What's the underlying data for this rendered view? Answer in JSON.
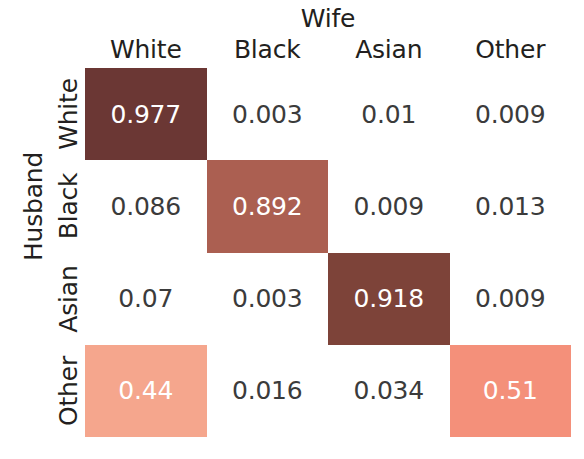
{
  "chart_data": {
    "type": "heatmap",
    "title": "",
    "xlabel": "Wife",
    "ylabel": "Husband",
    "categories_x": [
      "White",
      "Black",
      "Asian",
      "Other"
    ],
    "categories_y": [
      "White",
      "Black",
      "Asian",
      "Other"
    ],
    "grid": false,
    "legend": "none",
    "value_range": [
      0,
      1
    ],
    "rows": [
      {
        "label": "White",
        "cells": [
          {
            "value": "0.977",
            "filled": true,
            "color": "#6b3734"
          },
          {
            "value": "0.003",
            "filled": false,
            "color": "#ffffff"
          },
          {
            "value": "0.01",
            "filled": false,
            "color": "#ffffff"
          },
          {
            "value": "0.009",
            "filled": false,
            "color": "#ffffff"
          }
        ]
      },
      {
        "label": "Black",
        "cells": [
          {
            "value": "0.086",
            "filled": false,
            "color": "#ffffff"
          },
          {
            "value": "0.892",
            "filled": true,
            "color": "#ab5f51"
          },
          {
            "value": "0.009",
            "filled": false,
            "color": "#ffffff"
          },
          {
            "value": "0.013",
            "filled": false,
            "color": "#ffffff"
          }
        ]
      },
      {
        "label": "Asian",
        "cells": [
          {
            "value": "0.07",
            "filled": false,
            "color": "#ffffff"
          },
          {
            "value": "0.003",
            "filled": false,
            "color": "#ffffff"
          },
          {
            "value": "0.918",
            "filled": true,
            "color": "#7d4339"
          },
          {
            "value": "0.009",
            "filled": false,
            "color": "#ffffff"
          }
        ]
      },
      {
        "label": "Other",
        "cells": [
          {
            "value": "0.44",
            "filled": true,
            "color": "#f5a68d"
          },
          {
            "value": "0.016",
            "filled": false,
            "color": "#ffffff"
          },
          {
            "value": "0.034",
            "filled": false,
            "color": "#ffffff"
          },
          {
            "value": "0.51",
            "filled": true,
            "color": "#f4907a"
          }
        ]
      }
    ],
    "values": [
      [
        0.977,
        0.003,
        0.01,
        0.009
      ],
      [
        0.086,
        0.892,
        0.009,
        0.013
      ],
      [
        0.07,
        0.003,
        0.918,
        0.009
      ],
      [
        0.44,
        0.016,
        0.034,
        0.51
      ]
    ]
  }
}
